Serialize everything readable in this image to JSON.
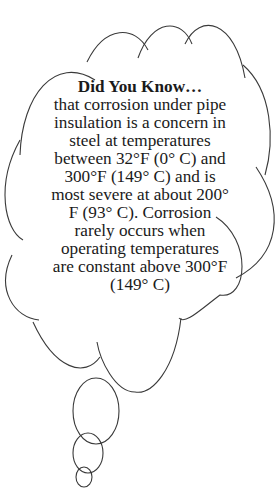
{
  "callout": {
    "title": "Did You Know…",
    "lines": [
      "that corrosion under pipe",
      "insulation is a concern in",
      "steel at temperatures",
      "between 32°F (0° C) and",
      "300°F (149° C) and is",
      "most severe at about 200°",
      "F (93° C).  Corrosion",
      "rarely occurs when",
      "operating temperatures",
      "are constant above 300°F",
      "(149° C)"
    ]
  },
  "colors": {
    "stroke": "#3a3a3a",
    "text": "#1a1a1a",
    "background": "#ffffff"
  }
}
